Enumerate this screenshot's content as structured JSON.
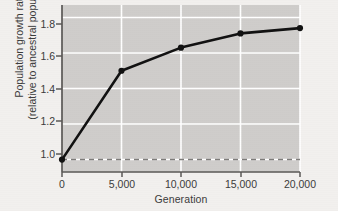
{
  "chart_data": {
    "type": "line",
    "title": "",
    "xlabel": "Generation",
    "ylabel_line1": "Population growth rate",
    "ylabel_line2": "(relative to ancestral population)",
    "x": [
      0,
      5000,
      10000,
      15000,
      20000
    ],
    "values": [
      1.0,
      1.5,
      1.63,
      1.71,
      1.74
    ],
    "series": [
      {
        "name": "Population growth rate",
        "values": [
          1.0,
          1.5,
          1.63,
          1.71,
          1.74
        ]
      }
    ],
    "xlim": [
      0,
      20000
    ],
    "ylim": [
      0.93,
      1.87
    ],
    "xticks": [
      0,
      5000,
      10000,
      15000,
      20000
    ],
    "xtick_labels": [
      "0",
      "5,000",
      "10,000",
      "15,000",
      "20,000"
    ],
    "yticks": [
      1.0,
      1.2,
      1.4,
      1.6,
      1.8
    ],
    "ytick_labels": [
      "1.0",
      "1.2",
      "1.4",
      "1.6",
      "1.8"
    ],
    "grid": true,
    "grid_color": "#ffffff",
    "legend": "none",
    "plot_background": "#cfcdcb",
    "figure_background": "#f2f0ee",
    "line_color": "#111111",
    "marker_color": "#111111",
    "marker_shape": "circle",
    "annotations": [
      {
        "name": "ancestral-reference-line",
        "type": "hline",
        "y": 1.0,
        "style": "dashed",
        "color": "#7d7b79"
      }
    ]
  },
  "axis": {
    "axis_line_color": "#5a5856"
  }
}
